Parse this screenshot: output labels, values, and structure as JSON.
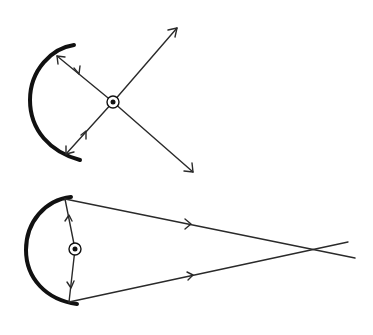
{
  "diagram": {
    "colors": {
      "ink": "#2a2a2a",
      "mirror": "#111111",
      "background": "#ffffff"
    },
    "top_figure": {
      "mirror": {
        "type": "concave-arc",
        "start": [
          72,
          45
        ],
        "mid": [
          30,
          100
        ],
        "end": [
          80,
          160
        ]
      },
      "source": {
        "center": [
          113,
          102
        ],
        "radius": 6
      },
      "rays": [
        {
          "from": [
            113,
            102
          ],
          "to": [
            57,
            56
          ],
          "arrowheads": [
            "mid-toward-source",
            "end-at-mirror"
          ]
        },
        {
          "from": [
            113,
            102
          ],
          "to": [
            66,
            154
          ],
          "arrowheads": [
            "mid-toward-source",
            "end-at-mirror"
          ]
        },
        {
          "from": [
            113,
            102
          ],
          "to": [
            177,
            28
          ],
          "arrowheads": [
            "end"
          ]
        },
        {
          "from": [
            113,
            102
          ],
          "to": [
            193,
            172
          ],
          "arrowheads": [
            "end"
          ]
        }
      ]
    },
    "bottom_figure": {
      "mirror": {
        "type": "concave-arc",
        "start": [
          70,
          197
        ],
        "mid": [
          26,
          250
        ],
        "end": [
          76,
          304
        ]
      },
      "source": {
        "center": [
          75,
          249
        ],
        "radius": 6
      },
      "rays": [
        {
          "from": [
            75,
            249
          ],
          "to": [
            66,
            200
          ],
          "arrowheads": [
            "mid-up"
          ]
        },
        {
          "from": [
            75,
            249
          ],
          "to": [
            70,
            300
          ],
          "arrowheads": [
            "mid-down"
          ]
        },
        {
          "from": [
            66,
            200
          ],
          "to": [
            355,
            258
          ],
          "arrowheads": [
            "mid-right"
          ]
        },
        {
          "from": [
            70,
            302
          ],
          "to": [
            348,
            242
          ],
          "arrowheads": [
            "mid-right"
          ]
        }
      ],
      "crossing_point": [
        318,
        250
      ]
    }
  }
}
